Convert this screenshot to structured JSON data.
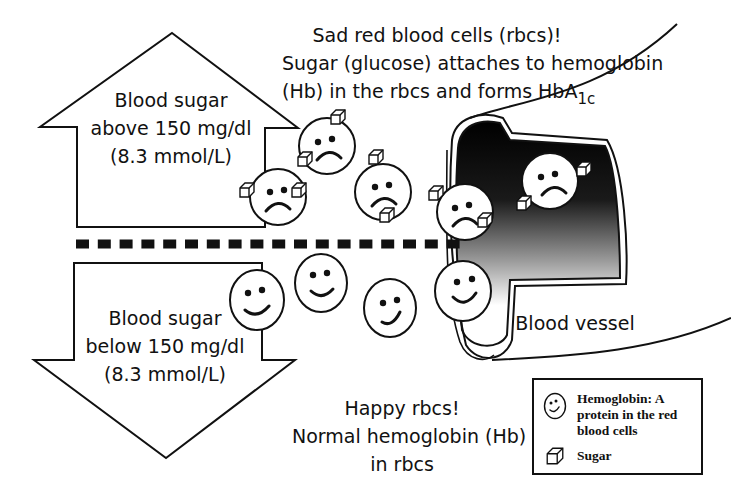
{
  "colors": {
    "ink": "#111111",
    "background": "#ffffff",
    "vessel_gradient_dark": "#000000",
    "vessel_gradient_light": "#ffffff"
  },
  "up_arrow": {
    "direction": "up",
    "lines": [
      "Blood sugar",
      "above 150 mg/dl",
      "(8.3 mmol/L)"
    ]
  },
  "down_arrow": {
    "direction": "down",
    "lines": [
      "Blood sugar",
      "below 150 mg/dl",
      "(8.3 mmol/L)"
    ]
  },
  "top_caption": {
    "line1": "Sad red blood cells (rbcs)!",
    "line2": "Sugar (glucose) attaches to hemoglobin",
    "line3_main": "(Hb) in the rbcs and forms HbA",
    "line3_subscript": "1c"
  },
  "bottom_caption": {
    "lines": [
      "Happy rbcs!",
      "Normal hemoglobin (Hb)",
      "in rbcs"
    ]
  },
  "vessel": {
    "label": "Blood vessel"
  },
  "threshold_line": {
    "style": "dashed",
    "segments": 18
  },
  "sad_cells": [
    {
      "cx": 278,
      "cy": 197,
      "r": 28,
      "sugar_cubes": 2
    },
    {
      "cx": 327,
      "cy": 146,
      "r": 28,
      "sugar_cubes": 2
    },
    {
      "cx": 383,
      "cy": 192,
      "r": 28,
      "sugar_cubes": 2
    },
    {
      "cx": 465,
      "cy": 212,
      "r": 28,
      "sugar_cubes": 2
    },
    {
      "cx": 550,
      "cy": 181,
      "r": 28,
      "sugar_cubes": 2
    }
  ],
  "happy_cells": [
    {
      "cx": 257,
      "cy": 300,
      "r": 28
    },
    {
      "cx": 321,
      "cy": 283,
      "r": 28
    },
    {
      "cx": 390,
      "cy": 308,
      "r": 28
    },
    {
      "cx": 463,
      "cy": 291,
      "r": 28
    }
  ],
  "legend": {
    "items": [
      {
        "icon": "happy-face-icon",
        "label_lines": [
          "Hemoglobin: A",
          "protein in the red",
          "blood cells"
        ]
      },
      {
        "icon": "sugar-cube-icon",
        "label_lines": [
          "Sugar"
        ]
      }
    ]
  }
}
